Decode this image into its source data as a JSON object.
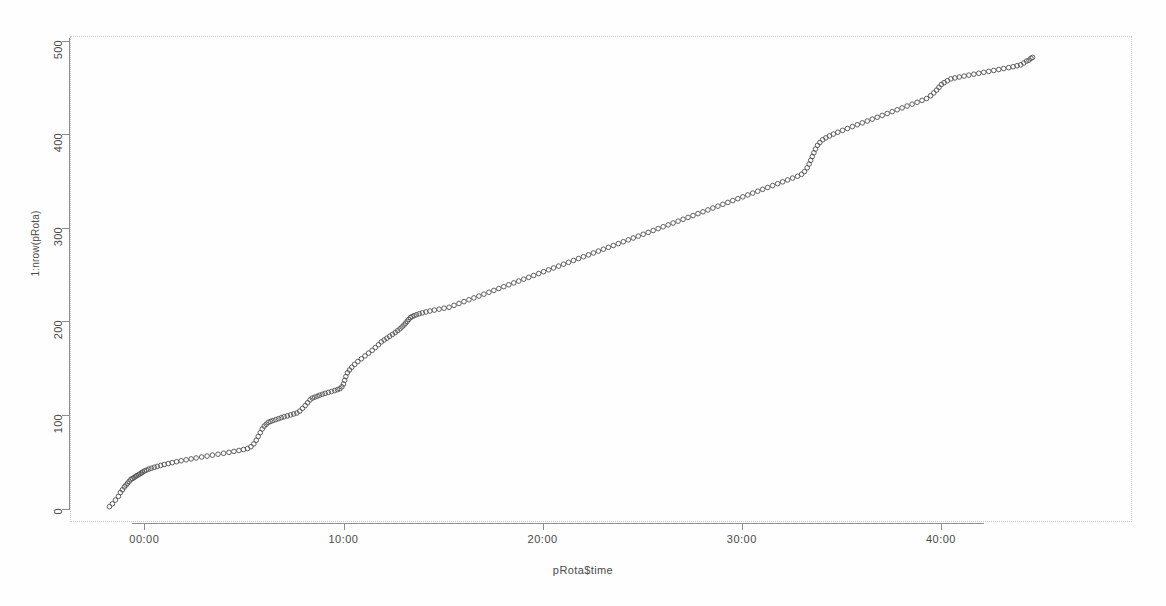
{
  "chart_data": {
    "type": "scatter",
    "title": "",
    "subtitle": "",
    "xlabel": "pRota$time",
    "ylabel": "1:nrow(pRota)",
    "xlim": [
      -2.2,
      45.5
    ],
    "ylim": [
      0,
      500
    ],
    "grid": false,
    "legend": null,
    "marker": "open-circle",
    "marker_color": "#4f4f4f",
    "x_tick_labels": [
      "00:00",
      "10:00",
      "20:00",
      "30:00",
      "40:00"
    ],
    "x_tick_values": [
      0,
      10,
      20,
      30,
      40
    ],
    "y_tick_labels": [
      "0",
      "100",
      "200",
      "300",
      "400",
      "500"
    ],
    "y_tick_values": [
      0,
      100,
      200,
      300,
      400,
      500
    ],
    "x_tick_format": "HH:MM",
    "n_points": 484,
    "x": [
      -1.75,
      -1.6,
      -1.45,
      -1.3,
      -1.2,
      -1.1,
      -1.0,
      -0.92,
      -0.84,
      -0.76,
      -0.68,
      -0.6,
      -0.52,
      -0.45,
      -0.38,
      -0.3,
      -0.22,
      -0.15,
      -0.08,
      0.0,
      0.1,
      0.22,
      0.35,
      0.5,
      0.65,
      0.82,
      1.0,
      1.2,
      1.4,
      1.62,
      1.85,
      2.1,
      2.35,
      2.6,
      2.88,
      3.15,
      3.42,
      3.7,
      3.98,
      4.25,
      4.5,
      4.75,
      4.98,
      5.18,
      5.35,
      5.5,
      5.62,
      5.72,
      5.82,
      5.92,
      6.02,
      6.12,
      6.22,
      6.34,
      6.46,
      6.6,
      6.74,
      6.88,
      7.02,
      7.18,
      7.34,
      7.5,
      7.66,
      7.8,
      7.94,
      8.08,
      8.2,
      8.32,
      8.44,
      8.56,
      8.68,
      8.8,
      8.94,
      9.08,
      9.24,
      9.4,
      9.56,
      9.7,
      9.82,
      9.92,
      10.0,
      10.06,
      10.12,
      10.2,
      10.3,
      10.42,
      10.56,
      10.72,
      10.9,
      11.08,
      11.26,
      11.44,
      11.6,
      11.76,
      11.9,
      12.04,
      12.18,
      12.32,
      12.46,
      12.6,
      12.72,
      12.84,
      12.94,
      13.04,
      13.12,
      13.2,
      13.28,
      13.36,
      13.44,
      13.54,
      13.66,
      13.8,
      13.96,
      14.14,
      14.34,
      14.56,
      14.8,
      15.05,
      15.3,
      15.55,
      15.8,
      16.05,
      16.3,
      16.55,
      16.8,
      17.05,
      17.3,
      17.55,
      17.8,
      18.05,
      18.3,
      18.55,
      18.8,
      19.05,
      19.3,
      19.55,
      19.8,
      20.05,
      20.3,
      20.55,
      20.8,
      21.05,
      21.3,
      21.55,
      21.8,
      22.05,
      22.3,
      22.55,
      22.8,
      23.05,
      23.3,
      23.55,
      23.8,
      24.05,
      24.3,
      24.55,
      24.8,
      25.05,
      25.3,
      25.55,
      25.8,
      26.05,
      26.3,
      26.55,
      26.8,
      27.05,
      27.3,
      27.55,
      27.8,
      28.05,
      28.3,
      28.55,
      28.8,
      29.05,
      29.3,
      29.55,
      29.8,
      30.05,
      30.3,
      30.55,
      30.8,
      31.05,
      31.3,
      31.55,
      31.8,
      32.05,
      32.3,
      32.55,
      32.8,
      33.0,
      33.15,
      33.28,
      33.38,
      33.46,
      33.54,
      33.62,
      33.7,
      33.8,
      33.92,
      34.06,
      34.22,
      34.4,
      34.6,
      34.82,
      35.06,
      35.3,
      35.55,
      35.8,
      36.05,
      36.3,
      36.55,
      36.8,
      37.05,
      37.3,
      37.55,
      37.8,
      38.05,
      38.3,
      38.55,
      38.8,
      39.05,
      39.28,
      39.48,
      39.64,
      39.78,
      39.9,
      40.02,
      40.16,
      40.32,
      40.5,
      40.7,
      40.92,
      41.16,
      41.4,
      41.65,
      41.9,
      42.15,
      42.4,
      42.65,
      42.9,
      43.15,
      43.4,
      43.62,
      43.82,
      44.0,
      44.16,
      44.3,
      44.42,
      44.52,
      44.6
    ],
    "y": [
      2,
      5,
      9,
      13,
      17,
      20,
      23,
      25,
      27,
      29,
      31,
      32,
      33,
      34,
      35,
      36,
      37,
      38,
      39,
      40,
      41,
      42,
      43,
      44,
      45,
      46,
      47,
      48,
      49,
      50,
      51,
      52,
      53,
      54,
      55,
      56,
      57,
      58,
      59,
      60,
      61,
      62,
      63,
      64,
      66,
      69,
      73,
      77,
      81,
      85,
      88,
      90,
      92,
      93,
      94,
      95,
      96,
      97,
      98,
      99,
      100,
      101,
      102,
      104,
      107,
      110,
      113,
      116,
      118,
      119,
      120,
      121,
      122,
      123,
      124,
      125,
      126,
      127,
      128,
      130,
      133,
      137,
      141,
      145,
      148,
      151,
      154,
      157,
      160,
      163,
      166,
      169,
      172,
      175,
      178,
      180,
      182,
      184,
      186,
      188,
      190,
      192,
      194,
      196,
      198,
      200,
      202,
      204,
      205,
      206,
      207,
      208,
      209,
      210,
      211,
      212,
      213,
      214,
      215,
      217,
      219,
      221,
      223,
      225,
      227,
      229,
      231,
      233,
      235,
      237,
      239,
      241,
      243,
      245,
      247,
      249,
      251,
      253,
      255,
      257,
      259,
      261,
      263,
      265,
      267,
      269,
      271,
      273,
      275,
      277,
      279,
      281,
      283,
      285,
      287,
      289,
      291,
      293,
      295,
      297,
      299,
      301,
      303,
      305,
      307,
      309,
      311,
      313,
      315,
      317,
      319,
      321,
      323,
      325,
      327,
      329,
      331,
      333,
      335,
      337,
      339,
      341,
      343,
      345,
      347,
      349,
      351,
      353,
      355,
      357,
      360,
      364,
      368,
      372,
      376,
      380,
      384,
      388,
      391,
      394,
      396,
      398,
      400,
      402,
      404,
      406,
      408,
      410,
      412,
      414,
      416,
      418,
      420,
      422,
      424,
      426,
      428,
      430,
      432,
      434,
      436,
      438,
      441,
      444,
      447,
      450,
      453,
      455,
      457,
      459,
      460,
      461,
      462,
      463,
      464,
      465,
      466,
      467,
      468,
      469,
      470,
      471,
      472,
      473,
      474,
      476,
      478,
      479,
      481,
      482
    ]
  }
}
